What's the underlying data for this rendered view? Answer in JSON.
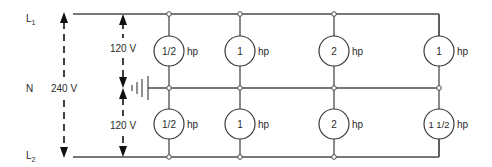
{
  "labels": {
    "line1": "L",
    "line1_sub": "1",
    "neutral": "N",
    "line2": "L",
    "line2_sub": "2",
    "voltage_total": "240 V",
    "voltage_upper": "120 V",
    "voltage_lower": "120 V"
  },
  "unit": "hp",
  "motors_upper": [
    {
      "rating": "1/2",
      "unit": "hp"
    },
    {
      "rating": "1",
      "unit": "hp"
    },
    {
      "rating": "2",
      "unit": "hp"
    },
    {
      "rating": "1",
      "unit": "hp"
    }
  ],
  "motors_lower": [
    {
      "rating": "1/2",
      "unit": "hp"
    },
    {
      "rating": "1",
      "unit": "hp"
    },
    {
      "rating": "2",
      "unit": "hp"
    },
    {
      "rating": "1 1/2",
      "unit": "hp"
    }
  ],
  "colors": {
    "wire": "#4a4a4a",
    "text": "#2a2a2a",
    "background": "#ffffff"
  }
}
